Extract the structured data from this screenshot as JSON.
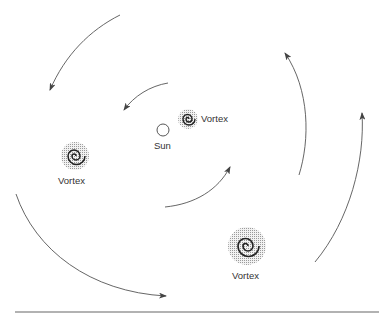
{
  "diagram": {
    "title": "",
    "labels": {
      "sun": "Sun",
      "vortex_small": "Vortex",
      "vortex_left": "Vortex",
      "vortex_large": "Vortex"
    },
    "nodes": [
      {
        "id": "sun",
        "label": "Sun",
        "shape": "circle",
        "cx": 163,
        "cy": 130,
        "r": 6
      },
      {
        "id": "vortex_small",
        "label": "Vortex",
        "shape": "spiral",
        "cx": 188,
        "cy": 119,
        "r": 11
      },
      {
        "id": "vortex_left",
        "label": "Vortex",
        "shape": "spiral",
        "cx": 75,
        "cy": 156,
        "r": 15
      },
      {
        "id": "vortex_large",
        "label": "Vortex",
        "shape": "spiral",
        "cx": 247,
        "cy": 246,
        "r": 19
      }
    ],
    "arrows": [
      {
        "id": "outer-top-left",
        "direction": "counterclockwise"
      },
      {
        "id": "inner-top",
        "direction": "counterclockwise"
      },
      {
        "id": "inner-bottom",
        "direction": "counterclockwise"
      },
      {
        "id": "outer-bottom-left",
        "direction": "counterclockwise"
      },
      {
        "id": "outer-right-1",
        "direction": "counterclockwise"
      },
      {
        "id": "outer-right-2",
        "direction": "counterclockwise"
      }
    ],
    "colors": {
      "stroke": "#555555",
      "spiral": "#222222",
      "halo": "#d8d8d8"
    }
  }
}
